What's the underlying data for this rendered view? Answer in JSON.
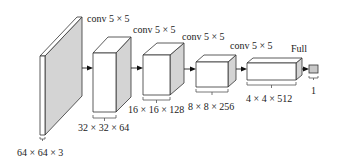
{
  "diagram": {
    "type": "cnn-architecture",
    "colors": {
      "side_face": "#d4d4d4",
      "front_face": "#ffffff",
      "stroke": "#333333"
    },
    "layers": [
      {
        "id": "input",
        "size_label": "64 × 64 × 3",
        "op_label": "conv 5 × 5"
      },
      {
        "id": "layer1",
        "size_label": "32 × 32 × 64",
        "op_label": "conv 5 × 5"
      },
      {
        "id": "layer2",
        "size_label": "16 × 16 × 128",
        "op_label": "conv 5 × 5"
      },
      {
        "id": "layer3",
        "size_label": "8 × 8 × 256",
        "op_label": "conv 5 × 5"
      },
      {
        "id": "layer4",
        "size_label": "4 × 4 × 512",
        "op_label": "Full"
      },
      {
        "id": "output",
        "size_label": "1"
      }
    ]
  }
}
